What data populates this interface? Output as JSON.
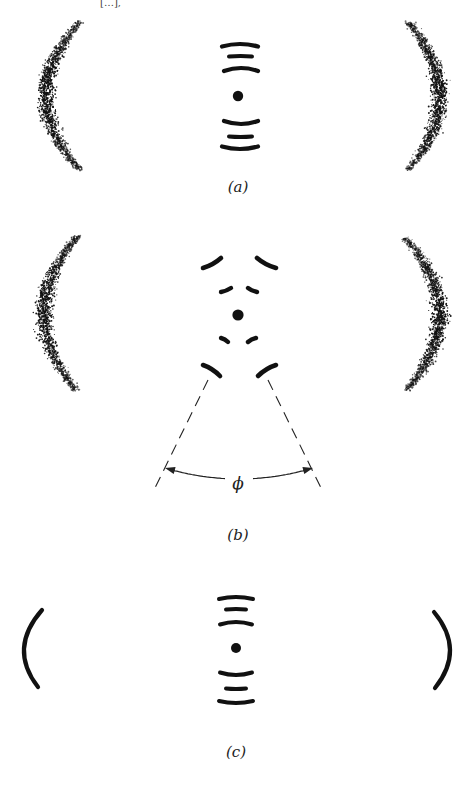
{
  "figure": {
    "width": 476,
    "height": 788,
    "background": "#ffffff",
    "ink_color": "#111111",
    "top_fragment": {
      "text": "[…],",
      "x": 100,
      "y": 2
    }
  },
  "panels": [
    {
      "id": "a",
      "label": "(a)",
      "label_pos": {
        "x": 238,
        "y": 192
      },
      "center_dot": {
        "x": 238,
        "y": 96,
        "r": 5.2
      },
      "center_arcs": [
        {
          "x1": 222,
          "x2": 258,
          "y": 44,
          "sag": 5,
          "w": 4.2
        },
        {
          "x1": 229,
          "x2": 252,
          "y": 56,
          "sag": 1,
          "w": 4.0
        },
        {
          "x1": 224,
          "x2": 258,
          "y": 68,
          "sag": 6,
          "w": 4.2
        },
        {
          "x1": 224,
          "x2": 258,
          "y": 124,
          "sag": -6,
          "w": 4.2
        },
        {
          "x1": 229,
          "x2": 252,
          "y": 137,
          "sag": -1,
          "w": 4.0
        },
        {
          "x1": 222,
          "x2": 258,
          "y": 149,
          "sag": -5,
          "w": 4.2
        }
      ],
      "outer_reflections": {
        "style": "stippled",
        "left": {
          "top": {
            "x": 80,
            "y": 22
          },
          "bottom": {
            "x": 80,
            "y": 170
          },
          "bulge_x": 46,
          "thickness": 14
        },
        "right": {
          "top": {
            "x": 408,
            "y": 22
          },
          "bottom": {
            "x": 408,
            "y": 170
          },
          "bulge_x": 440,
          "thickness": 14
        }
      }
    },
    {
      "id": "b",
      "label": "(b)",
      "label_pos": {
        "x": 238,
        "y": 540
      },
      "center_dot": {
        "x": 238,
        "y": 315,
        "r": 5.6
      },
      "center_segments": [
        {
          "x1": 203,
          "y1": 268,
          "x2": 221,
          "y2": 258,
          "w": 4.6
        },
        {
          "x1": 257,
          "y1": 258,
          "x2": 276,
          "y2": 268,
          "w": 4.6
        },
        {
          "x1": 221,
          "y1": 292,
          "x2": 231,
          "y2": 288,
          "w": 4.4
        },
        {
          "x1": 248,
          "y1": 288,
          "x2": 257,
          "y2": 292,
          "w": 4.4
        },
        {
          "x1": 221,
          "y1": 338,
          "x2": 228,
          "y2": 342,
          "w": 4.4
        },
        {
          "x1": 248,
          "y1": 342,
          "x2": 256,
          "y2": 338,
          "w": 4.4
        },
        {
          "x1": 203,
          "y1": 365,
          "x2": 220,
          "y2": 376,
          "w": 4.6
        },
        {
          "x1": 258,
          "y1": 376,
          "x2": 276,
          "y2": 365,
          "w": 4.6
        }
      ],
      "dashed_lines": [
        {
          "x1": 208,
          "y1": 380,
          "x2": 153,
          "y2": 492
        },
        {
          "x1": 268,
          "y1": 380,
          "x2": 323,
          "y2": 492
        }
      ],
      "angle_arrow": {
        "start": {
          "x": 165,
          "y": 468
        },
        "end": {
          "x": 313,
          "y": 468
        },
        "control": {
          "x": 239,
          "y": 490
        },
        "gap_half_width": 14
      },
      "angle_label": {
        "text": "ϕ",
        "x": 238,
        "y": 489
      },
      "outer_reflections": {
        "style": "stippled",
        "left": {
          "top": {
            "x": 78,
            "y": 236
          },
          "bottom": {
            "x": 76,
            "y": 390
          },
          "bulge_x": 44,
          "thickness": 14
        },
        "right": {
          "top": {
            "x": 405,
            "y": 238
          },
          "bottom": {
            "x": 407,
            "y": 390
          },
          "bulge_x": 440,
          "thickness": 14
        }
      }
    },
    {
      "id": "c",
      "label": "(c)",
      "label_pos": {
        "x": 236,
        "y": 757
      },
      "center_dot": {
        "x": 236,
        "y": 648,
        "r": 5.0
      },
      "center_arcs": [
        {
          "x1": 219,
          "x2": 253,
          "y": 597,
          "sag": 4,
          "w": 4.0
        },
        {
          "x1": 226,
          "x2": 246,
          "y": 609,
          "sag": 1,
          "w": 4.0
        },
        {
          "x1": 220,
          "x2": 252,
          "y": 622,
          "sag": 5,
          "w": 4.0
        },
        {
          "x1": 220,
          "x2": 252,
          "y": 675,
          "sag": -5,
          "w": 4.0
        },
        {
          "x1": 226,
          "x2": 246,
          "y": 689,
          "sag": -1,
          "w": 4.0
        },
        {
          "x1": 219,
          "x2": 253,
          "y": 703,
          "sag": -4,
          "w": 4.0
        }
      ],
      "outer_reflections": {
        "style": "solid",
        "left": {
          "top": {
            "x": 42,
            "y": 610
          },
          "bottom": {
            "x": 38,
            "y": 687
          },
          "bulge_x": 24,
          "width": 4.2
        },
        "right": {
          "top": {
            "x": 434,
            "y": 612
          },
          "bottom": {
            "x": 435,
            "y": 688
          },
          "bulge_x": 450,
          "width": 4.2
        }
      }
    }
  ]
}
